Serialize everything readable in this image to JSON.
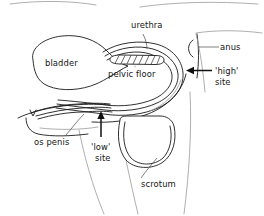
{
  "figure": {
    "background_color": "#ffffff",
    "line_color": "#1a1a1a",
    "faint_line_color": "#9a9a9a",
    "width": 264,
    "height": 216
  },
  "labels": {
    "urethra": "urethra",
    "bladder": "bladder",
    "pelvic_floor": "pelvic floor",
    "anus": "anus",
    "high_site_line1": "'high'",
    "high_site_line2": "site",
    "os_penis": "os penis",
    "low_site_line1": "'low'",
    "low_site_line2": "site",
    "scrotum": "scrotum"
  },
  "annotations": [
    {
      "name": "high-site-arrow",
      "direction": "left",
      "points_to": "'high' site"
    },
    {
      "name": "low-site-arrow",
      "direction": "up",
      "points_to": "'low' site"
    }
  ],
  "structures": [
    "bladder",
    "urethra",
    "pelvic floor",
    "anus",
    "os penis",
    "scrotum",
    "body outline"
  ]
}
